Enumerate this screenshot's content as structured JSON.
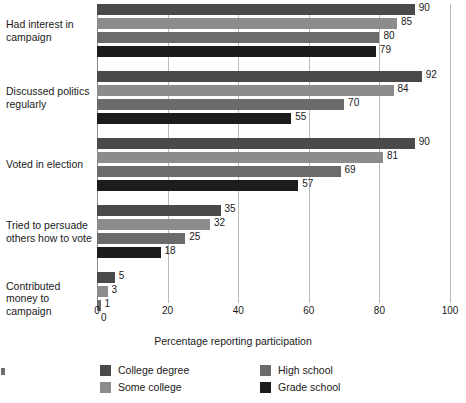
{
  "chart_data": {
    "type": "bar",
    "orientation": "horizontal",
    "title": "",
    "xlabel": "Percentage reporting participation",
    "ylabel": "",
    "xlim": [
      0,
      100
    ],
    "xticks": [
      0,
      20,
      40,
      60,
      80,
      100
    ],
    "grid": true,
    "legend_position": "bottom",
    "categories": [
      "Had interest in campaign",
      "Discussed politics regularly",
      "Voted in election",
      "Tried to persuade others how to vote",
      "Contributed money to campaign"
    ],
    "series": [
      {
        "name": "College degree",
        "color": "#4a4a4a",
        "values": [
          90,
          92,
          90,
          35,
          5
        ]
      },
      {
        "name": "Some college",
        "color": "#8c8c8c",
        "values": [
          85,
          84,
          81,
          32,
          3
        ]
      },
      {
        "name": "High school",
        "color": "#6b6b6b",
        "values": [
          80,
          70,
          69,
          25,
          1
        ]
      },
      {
        "name": "Grade school",
        "color": "#1c1c1c",
        "values": [
          79,
          55,
          57,
          18,
          0
        ]
      }
    ]
  },
  "axis": {
    "x_title": "Percentage reporting participation",
    "ticks": [
      "0",
      "20",
      "40",
      "60",
      "80",
      "100"
    ]
  },
  "category_labels": [
    "Had interest in\ncampaign",
    "Discussed politics\nregularly",
    "Voted in election",
    "Tried to persuade\nothers how to vote",
    "Contributed\nmoney to\ncampaign"
  ],
  "legend": {
    "items": [
      {
        "label": "College degree",
        "color": "#4a4a4a"
      },
      {
        "label": "Some college",
        "color": "#8c8c8c"
      },
      {
        "label": "High school",
        "color": "#6b6b6b"
      },
      {
        "label": "Grade school",
        "color": "#1c1c1c"
      }
    ]
  },
  "colors": {
    "background": "#ffffff",
    "text": "#1a1a1a",
    "gridline": "#b9b9b9",
    "axis": "#8a8a8a"
  }
}
